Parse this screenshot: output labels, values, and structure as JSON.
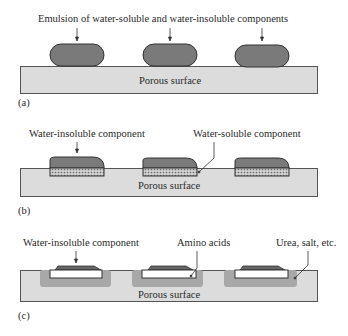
{
  "figure": {
    "colors": {
      "surface_fill": "#dcdcdc",
      "droplet_fill": "#7a7a7a",
      "soluble_zone_fill": "#a8a8a8",
      "outline": "#444444",
      "insoluble_film_fill": "#ffffff"
    },
    "panels": [
      {
        "id": "a",
        "letter": "(a)",
        "surface_label": "Porous surface",
        "annotations": [
          {
            "text": "Emulsion of water-soluble and water-insoluble components"
          }
        ]
      },
      {
        "id": "b",
        "letter": "(b)",
        "surface_label": "Porous surface",
        "annotations": [
          {
            "text": "Water-insoluble component"
          },
          {
            "text": "Water-soluble component"
          }
        ]
      },
      {
        "id": "c",
        "letter": "(c)",
        "surface_label": "Porous surface",
        "annotations": [
          {
            "text": "Water-insoluble component"
          },
          {
            "text": "Amino acids"
          },
          {
            "text": "Urea, salt, etc."
          }
        ]
      }
    ]
  }
}
